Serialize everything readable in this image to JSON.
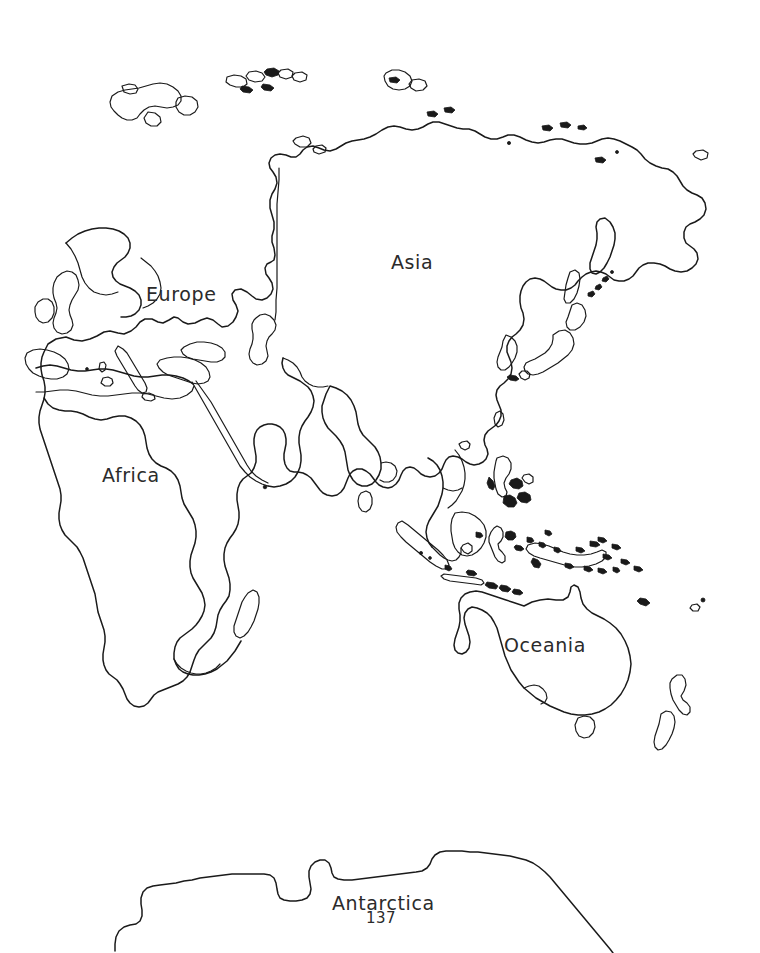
{
  "page": {
    "page_number": "137",
    "background_color": "#ffffff",
    "line_color": "#1a1a1a",
    "text_color": "#2b2b2b"
  },
  "labels": {
    "europe": "Europe",
    "asia": "Asia",
    "africa": "Africa",
    "oceania": "Oceania",
    "antarctica": "Antarctica"
  },
  "map": {
    "projection_note": "Eastern Hemisphere outline map",
    "continents": [
      {
        "name": "Europe",
        "label": "Europe"
      },
      {
        "name": "Asia",
        "label": "Asia"
      },
      {
        "name": "Africa",
        "label": "Africa"
      },
      {
        "name": "Oceania",
        "label": "Oceania"
      },
      {
        "name": "Antarctica",
        "label": "Antarctica"
      }
    ],
    "icons": {
      "landmass": "landmass-outline-icon",
      "island": "island-outline-icon"
    }
  }
}
